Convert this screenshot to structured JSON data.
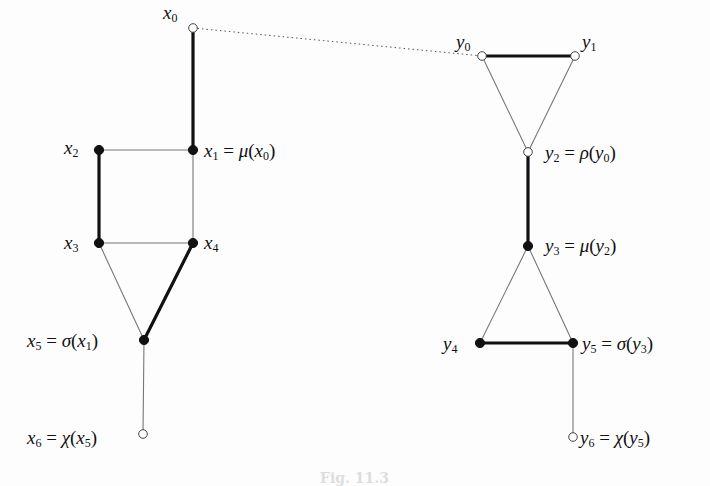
{
  "figure": {
    "caption": "Fig. 11.3",
    "left_graph": {
      "nodes": [
        {
          "id": "x0",
          "label": "x",
          "sub": "0",
          "rhs": "",
          "x": 193,
          "y": 28,
          "filled": false
        },
        {
          "id": "x1",
          "label": "x",
          "sub": "1",
          "rhs": " = μ(x₀)",
          "x": 193,
          "y": 150,
          "filled": true
        },
        {
          "id": "x2",
          "label": "x",
          "sub": "2",
          "rhs": "",
          "x": 99,
          "y": 150,
          "filled": true
        },
        {
          "id": "x3",
          "label": "x",
          "sub": "3",
          "rhs": "",
          "x": 99,
          "y": 243,
          "filled": true
        },
        {
          "id": "x4",
          "label": "x",
          "sub": "4",
          "rhs": "",
          "x": 193,
          "y": 243,
          "filled": true
        },
        {
          "id": "x5",
          "label": "x",
          "sub": "5",
          "rhs": " = σ(x₁)",
          "x": 144,
          "y": 340,
          "filled": true
        },
        {
          "id": "x6",
          "label": "x",
          "sub": "6",
          "rhs": " = χ(x₅)",
          "x": 143,
          "y": 434,
          "filled": false
        }
      ],
      "edges": [
        {
          "from": "x0",
          "to": "x1",
          "bold": true
        },
        {
          "from": "x2",
          "to": "x1",
          "bold": false
        },
        {
          "from": "x2",
          "to": "x3",
          "bold": true
        },
        {
          "from": "x1",
          "to": "x4",
          "bold": false
        },
        {
          "from": "x3",
          "to": "x4",
          "bold": false
        },
        {
          "from": "x3",
          "to": "x5",
          "bold": false
        },
        {
          "from": "x4",
          "to": "x5",
          "bold": true
        },
        {
          "from": "x5",
          "to": "x6",
          "bold": false
        }
      ]
    },
    "right_graph": {
      "nodes": [
        {
          "id": "y0",
          "label": "y",
          "sub": "0",
          "rhs": "",
          "x": 482,
          "y": 56,
          "filled": false
        },
        {
          "id": "y1",
          "label": "y",
          "sub": "1",
          "rhs": "",
          "x": 575,
          "y": 56,
          "filled": false
        },
        {
          "id": "y2",
          "label": "y",
          "sub": "2",
          "rhs": " = ρ(y₀)",
          "x": 528,
          "y": 152,
          "filled": false
        },
        {
          "id": "y3",
          "label": "y",
          "sub": "3",
          "rhs": " = μ(y₂)",
          "x": 528,
          "y": 246,
          "filled": true
        },
        {
          "id": "y4",
          "label": "y",
          "sub": "4",
          "rhs": "",
          "x": 480,
          "y": 343,
          "filled": true
        },
        {
          "id": "y5",
          "label": "y",
          "sub": "5",
          "rhs": " = σ(y₃)",
          "x": 573,
          "y": 343,
          "filled": true
        },
        {
          "id": "y6",
          "label": "y",
          "sub": "6",
          "rhs": " = χ(y₅)",
          "x": 573,
          "y": 437,
          "filled": false
        }
      ],
      "edges": [
        {
          "from": "y0",
          "to": "y1",
          "bold": true
        },
        {
          "from": "y0",
          "to": "y2",
          "bold": false
        },
        {
          "from": "y1",
          "to": "y2",
          "bold": false
        },
        {
          "from": "y2",
          "to": "y3",
          "bold": true
        },
        {
          "from": "y3",
          "to": "y4",
          "bold": false
        },
        {
          "from": "y3",
          "to": "y5",
          "bold": false
        },
        {
          "from": "y4",
          "to": "y5",
          "bold": true
        },
        {
          "from": "y5",
          "to": "y6",
          "bold": false
        }
      ]
    },
    "dotted_link": {
      "from": "x0",
      "to": "y0"
    },
    "labels": [
      {
        "node": "x0",
        "text": "x",
        "sub": "0",
        "rhs": "",
        "left": 163,
        "top": 3
      },
      {
        "node": "x1",
        "text": "x",
        "sub": "1",
        "rhs": " = μ(x",
        "rhs_sub": "0",
        "rhs_end": ")",
        "left": 204,
        "top": 141
      },
      {
        "node": "x2",
        "text": "x",
        "sub": "2",
        "rhs": "",
        "left": 64,
        "top": 138
      },
      {
        "node": "x3",
        "text": "x",
        "sub": "3",
        "rhs": "",
        "left": 64,
        "top": 233
      },
      {
        "node": "x4",
        "text": "x",
        "sub": "4",
        "rhs": "",
        "left": 204,
        "top": 233
      },
      {
        "node": "x5",
        "text": "x",
        "sub": "5",
        "rhs": " = σ(x",
        "rhs_sub": "1",
        "rhs_end": ")",
        "left": 27,
        "top": 331
      },
      {
        "node": "x6",
        "text": "x",
        "sub": "6",
        "rhs": " = χ(x",
        "rhs_sub": "5",
        "rhs_end": ")",
        "left": 27,
        "top": 428
      },
      {
        "node": "y0",
        "text": "y",
        "sub": "0",
        "rhs": "",
        "left": 456,
        "top": 32
      },
      {
        "node": "y1",
        "text": "y",
        "sub": "1",
        "rhs": "",
        "left": 582,
        "top": 32
      },
      {
        "node": "y2",
        "text": "y",
        "sub": "2",
        "rhs": " = ρ(y",
        "rhs_sub": "0",
        "rhs_end": ")",
        "left": 545,
        "top": 143
      },
      {
        "node": "y3",
        "text": "y",
        "sub": "3",
        "rhs": " = μ(y",
        "rhs_sub": "2",
        "rhs_end": ")",
        "left": 545,
        "top": 236
      },
      {
        "node": "y4",
        "text": "y",
        "sub": "4",
        "rhs": "",
        "left": 443,
        "top": 334
      },
      {
        "node": "y5",
        "text": "y",
        "sub": "5",
        "rhs": " = σ(y",
        "rhs_sub": "3",
        "rhs_end": ")",
        "left": 582,
        "top": 334
      },
      {
        "node": "y6",
        "text": "y",
        "sub": "6",
        "rhs": " = χ(y",
        "rhs_sub": "5",
        "rhs_end": ")",
        "left": 580,
        "top": 428
      }
    ]
  }
}
